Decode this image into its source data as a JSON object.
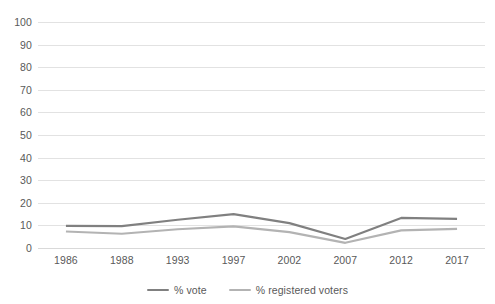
{
  "chart_data": {
    "type": "line",
    "title": "",
    "xlabel": "",
    "ylabel": "",
    "categories": [
      "1986",
      "1988",
      "1993",
      "1997",
      "2002",
      "2007",
      "2012",
      "2017"
    ],
    "series": [
      {
        "name": "% vote",
        "color": "#808080",
        "values": [
          9.8,
          9.7,
          12.5,
          15.0,
          11.0,
          4.0,
          13.3,
          12.9
        ]
      },
      {
        "name": "% registered voters",
        "color": "#b3b3b3",
        "values": [
          7.3,
          6.3,
          8.3,
          9.6,
          7.0,
          2.3,
          7.8,
          8.5
        ]
      }
    ],
    "ylim": [
      0,
      100
    ],
    "yticks": [
      "0",
      "10",
      "20",
      "30",
      "40",
      "50",
      "60",
      "70",
      "80",
      "90",
      "100"
    ],
    "grid": true,
    "grid_color": "#e2e2e2",
    "legend_position": "bottom",
    "background": "#ffffff"
  }
}
